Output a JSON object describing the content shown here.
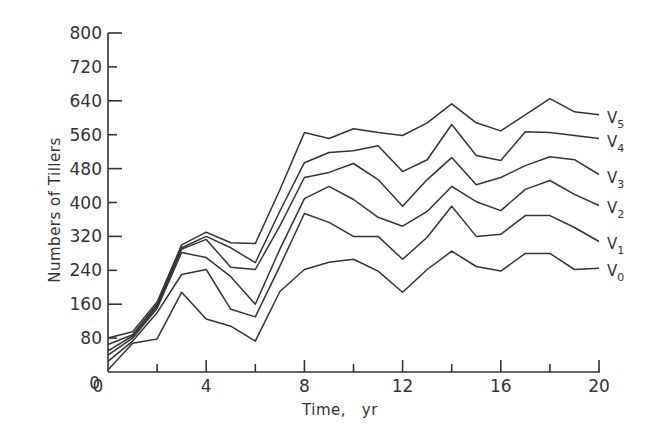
{
  "chart_data": {
    "type": "line",
    "title": "",
    "xlabel": "Time,   yr",
    "ylabel": "Numbers of Tillers",
    "xlim": [
      0,
      20
    ],
    "ylim": [
      0,
      800
    ],
    "x_ticks": [
      0,
      4,
      8,
      12,
      16,
      20
    ],
    "x_minor_ticks": [
      2,
      6,
      10,
      14,
      18
    ],
    "y_ticks": [
      0,
      80,
      160,
      240,
      320,
      400,
      480,
      560,
      640,
      720,
      800
    ],
    "grid": false,
    "legend": "inline labels at right end of each line",
    "x": [
      0,
      1,
      2,
      3,
      4,
      5,
      6,
      7,
      8,
      9,
      10,
      11,
      12,
      13,
      14,
      15,
      16,
      17,
      18,
      19,
      20
    ],
    "series": [
      {
        "name": "V5",
        "base": "V",
        "sub": "5",
        "values": [
          80,
          95,
          165,
          300,
          330,
          305,
          303,
          430,
          565,
          551,
          574,
          565,
          558,
          588,
          633,
          588,
          569,
          607,
          645,
          614,
          607
        ]
      },
      {
        "name": "V4",
        "base": "V",
        "sub": "4",
        "values": [
          65,
          88,
          160,
          293,
          320,
          293,
          258,
          380,
          494,
          518,
          522,
          534,
          473,
          501,
          584,
          511,
          499,
          567,
          565,
          558,
          551
        ]
      },
      {
        "name": "V3",
        "base": "V",
        "sub": "3",
        "values": [
          50,
          85,
          155,
          290,
          313,
          247,
          242,
          345,
          459,
          471,
          492,
          454,
          391,
          454,
          506,
          442,
          459,
          487,
          508,
          501,
          466
        ]
      },
      {
        "name": "V2",
        "base": "V",
        "sub": "2",
        "values": [
          40,
          80,
          150,
          282,
          270,
          225,
          160,
          290,
          409,
          438,
          407,
          365,
          344,
          379,
          438,
          402,
          381,
          431,
          452,
          419,
          393
        ]
      },
      {
        "name": "V1",
        "base": "V",
        "sub": "1",
        "values": [
          25,
          73,
          140,
          230,
          242,
          148,
          130,
          250,
          374,
          353,
          320,
          320,
          266,
          318,
          391,
          320,
          325,
          369,
          369,
          341,
          308
        ]
      },
      {
        "name": "V0",
        "base": "V",
        "sub": "0",
        "values": [
          5,
          68,
          78,
          188,
          125,
          108,
          73,
          190,
          242,
          259,
          266,
          238,
          188,
          242,
          285,
          249,
          238,
          280,
          280,
          242,
          245
        ]
      }
    ]
  },
  "axes": {
    "x_label": "Time,   yr",
    "y_label": "Numbers of Tillers"
  }
}
